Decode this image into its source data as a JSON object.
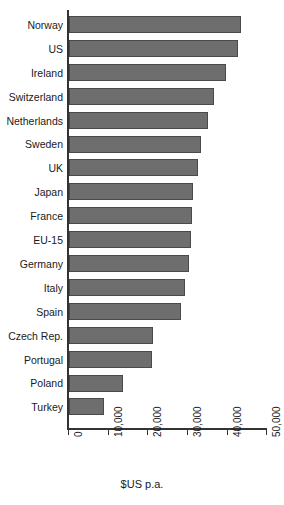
{
  "chart_data": {
    "type": "bar",
    "orientation": "horizontal",
    "title": "",
    "subtitle": "",
    "xlabel": "$US p.a.",
    "ylabel": "",
    "xlim": [
      0,
      50000
    ],
    "xticks": [
      0,
      10000,
      20000,
      30000,
      40000,
      50000
    ],
    "xtick_labels": [
      "0",
      "10,000",
      "20,000",
      "30,000",
      "40,000",
      "50,000"
    ],
    "grid": false,
    "legend": false,
    "bar_color": "#6e6e6e",
    "bar_edge_color": "#4a4a4a",
    "axis_color": "#333333",
    "categories": [
      "Norway",
      "US",
      "Ireland",
      "Switzerland",
      "Netherlands",
      "Sweden",
      "UK",
      "Japan",
      "France",
      "EU-15",
      "Germany",
      "Italy",
      "Spain",
      "Czech Rep.",
      "Portugal",
      "Poland",
      "Turkey"
    ],
    "values": [
      43300,
      42500,
      39500,
      36500,
      35000,
      33200,
      32500,
      31200,
      31000,
      30700,
      30200,
      29200,
      28200,
      21200,
      20900,
      13600,
      8800
    ],
    "units": "$US p.a."
  }
}
